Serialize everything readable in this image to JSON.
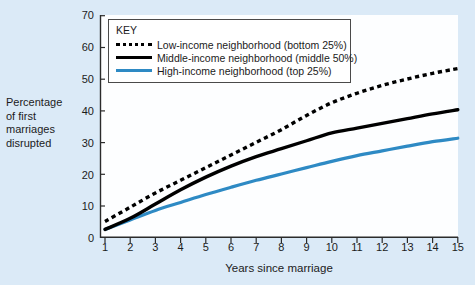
{
  "chart_data": {
    "type": "line",
    "title": "",
    "xlabel": "Years since marriage",
    "ylabel": "Percentage of first marriages disrupted",
    "ylabel_lines": [
      "Percentage",
      "of first",
      "marriages",
      "disrupted"
    ],
    "x": [
      1,
      2,
      3,
      4,
      5,
      6,
      7,
      8,
      9,
      10,
      11,
      12,
      13,
      14,
      15
    ],
    "xlim": [
      1,
      15
    ],
    "ylim": [
      0,
      70
    ],
    "yticks": [
      0,
      10,
      20,
      30,
      40,
      50,
      60,
      70
    ],
    "xticks": [
      1,
      2,
      3,
      4,
      5,
      6,
      7,
      8,
      9,
      10,
      11,
      12,
      13,
      14,
      15
    ],
    "grid": false,
    "legend_position": "top-left-inside",
    "legend_title": "KEY",
    "series": [
      {
        "name": "Low-income neighborhood (bottom 25%)",
        "style": "dotted",
        "color": "#000000",
        "values": [
          5,
          9.5,
          14,
          18,
          22,
          26,
          30,
          34,
          38.5,
          42.5,
          45.5,
          48,
          50,
          51.8,
          53.3
        ]
      },
      {
        "name": "Middle-income neighborhood (middle 50%)",
        "style": "solid",
        "color": "#000000",
        "values": [
          2.5,
          6,
          10.5,
          15,
          19,
          22.5,
          25.5,
          28,
          30.5,
          33,
          34.5,
          36,
          37.5,
          39,
          40.3
        ]
      },
      {
        "name": "High-income neighborhood (top 25%)",
        "style": "solid",
        "color": "#2e8ac4",
        "values": [
          2.5,
          5.5,
          8.5,
          11,
          13.5,
          15.8,
          18,
          20,
          22,
          24,
          25.8,
          27.3,
          28.8,
          30.2,
          31.3
        ]
      }
    ]
  },
  "legend": {
    "title": "KEY",
    "items": [
      {
        "label": "Low-income neighborhood (bottom 25%)",
        "swatch": "dotted-line-swatch"
      },
      {
        "label": "Middle-income neighborhood (middle 50%)",
        "swatch": "solid-black-line-swatch"
      },
      {
        "label": "High-income neighborhood (top 25%)",
        "swatch": "solid-blue-line-swatch"
      }
    ]
  },
  "axes": {
    "y_label_lines": [
      "Percentage",
      "of first",
      "marriages",
      "disrupted"
    ],
    "y_tick_labels": [
      "70",
      "60",
      "50",
      "40",
      "30",
      "20",
      "10",
      "0"
    ],
    "x_tick_labels": [
      "1",
      "2",
      "3",
      "4",
      "5",
      "6",
      "7",
      "8",
      "9",
      "10",
      "11",
      "12",
      "13",
      "14",
      "15"
    ],
    "x_axis_title": "Years since marriage"
  },
  "colors": {
    "page_background": "#dbeaf7",
    "plot_background": "#fdfeff",
    "series_low": "#000000",
    "series_middle": "#000000",
    "series_high": "#2e8ac4",
    "axis": "#2b2b2b"
  }
}
